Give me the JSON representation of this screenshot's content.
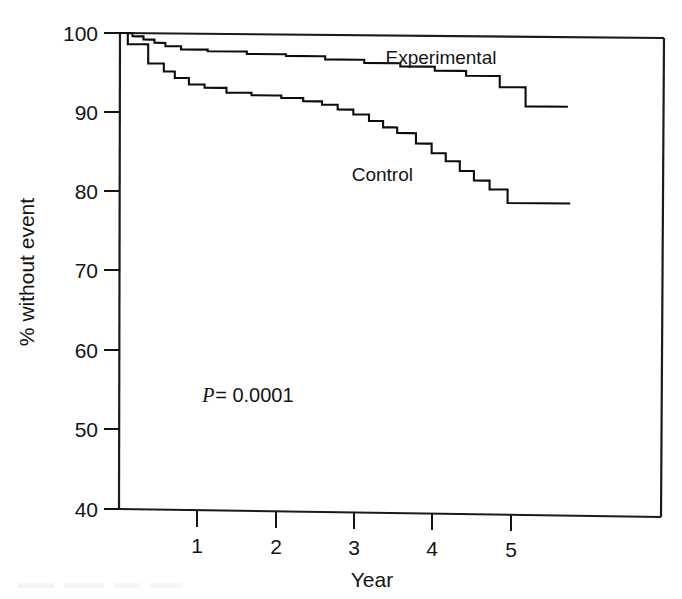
{
  "chart_data": {
    "type": "line",
    "subtype": "kaplan-meier-survival-step",
    "title": "",
    "xlabel": "Year",
    "ylabel": "% without event",
    "xlim": [
      0,
      7.0
    ],
    "ylim": [
      40,
      100
    ],
    "grid": false,
    "legend_position": "inline-annotation",
    "x_ticks": [
      1,
      2,
      3,
      4,
      5
    ],
    "x_tick_labels": [
      "1",
      "2",
      "3",
      "4",
      "5"
    ],
    "y_ticks": [
      40,
      50,
      60,
      70,
      80,
      90,
      100
    ],
    "y_tick_labels": [
      "40",
      "50",
      "60",
      "70",
      "80",
      "90",
      "100"
    ],
    "annotations": [
      {
        "name": "p-value",
        "text_italic": "P",
        "text_rest": " = 0.0001",
        "x": 1.05,
        "y": 53.6
      },
      {
        "name": "experimental-label",
        "text": "Experimental",
        "x": 4.1,
        "y": 96.4
      },
      {
        "name": "control-label",
        "text": "Control",
        "x": 3.35,
        "y": 81.6
      }
    ],
    "series": [
      {
        "name": "Experimental",
        "points": [
          [
            0.0,
            100.0
          ],
          [
            0.08,
            100.0
          ],
          [
            0.16,
            99.6
          ],
          [
            0.24,
            99.6
          ],
          [
            0.3,
            99.2
          ],
          [
            0.38,
            99.2
          ],
          [
            0.44,
            98.8
          ],
          [
            0.52,
            98.8
          ],
          [
            0.58,
            98.4
          ],
          [
            0.7,
            98.4
          ],
          [
            0.78,
            98.0
          ],
          [
            1.05,
            98.0
          ],
          [
            1.12,
            97.8
          ],
          [
            1.55,
            97.8
          ],
          [
            1.62,
            97.5
          ],
          [
            2.05,
            97.5
          ],
          [
            2.12,
            97.3
          ],
          [
            2.55,
            97.3
          ],
          [
            2.62,
            96.9
          ],
          [
            3.05,
            96.9
          ],
          [
            3.12,
            96.5
          ],
          [
            3.5,
            96.5
          ],
          [
            3.58,
            96.1
          ],
          [
            3.95,
            96.1
          ],
          [
            4.02,
            95.6
          ],
          [
            4.35,
            95.6
          ],
          [
            4.42,
            95.0
          ],
          [
            4.78,
            95.0
          ],
          [
            4.85,
            93.6
          ],
          [
            5.12,
            93.6
          ],
          [
            5.18,
            91.2
          ],
          [
            5.72,
            91.2
          ]
        ]
      },
      {
        "name": "Control",
        "points": [
          [
            0.0,
            100.0
          ],
          [
            0.06,
            100.0
          ],
          [
            0.1,
            98.6
          ],
          [
            0.3,
            98.6
          ],
          [
            0.36,
            96.2
          ],
          [
            0.5,
            96.2
          ],
          [
            0.56,
            95.2
          ],
          [
            0.64,
            95.2
          ],
          [
            0.7,
            94.4
          ],
          [
            0.82,
            94.4
          ],
          [
            0.88,
            93.6
          ],
          [
            1.02,
            93.6
          ],
          [
            1.08,
            93.2
          ],
          [
            1.3,
            93.2
          ],
          [
            1.36,
            92.6
          ],
          [
            1.62,
            92.6
          ],
          [
            1.68,
            92.3
          ],
          [
            2.0,
            92.3
          ],
          [
            2.06,
            92.0
          ],
          [
            2.28,
            92.0
          ],
          [
            2.34,
            91.6
          ],
          [
            2.52,
            91.6
          ],
          [
            2.58,
            91.2
          ],
          [
            2.72,
            91.2
          ],
          [
            2.78,
            90.6
          ],
          [
            2.92,
            90.6
          ],
          [
            2.98,
            90.0
          ],
          [
            3.12,
            90.0
          ],
          [
            3.18,
            89.2
          ],
          [
            3.3,
            89.2
          ],
          [
            3.36,
            88.4
          ],
          [
            3.48,
            88.4
          ],
          [
            3.54,
            87.7
          ],
          [
            3.72,
            87.7
          ],
          [
            3.78,
            86.4
          ],
          [
            3.92,
            86.4
          ],
          [
            3.98,
            85.2
          ],
          [
            4.1,
            85.2
          ],
          [
            4.16,
            84.2
          ],
          [
            4.28,
            84.2
          ],
          [
            4.34,
            83.0
          ],
          [
            4.45,
            83.0
          ],
          [
            4.52,
            81.8
          ],
          [
            4.66,
            81.8
          ],
          [
            4.72,
            80.7
          ],
          [
            4.88,
            80.7
          ],
          [
            4.95,
            79.0
          ],
          [
            5.75,
            79.0
          ]
        ]
      }
    ]
  },
  "axes": {
    "y_axis_title": "% without event",
    "x_axis_title": "Year"
  }
}
